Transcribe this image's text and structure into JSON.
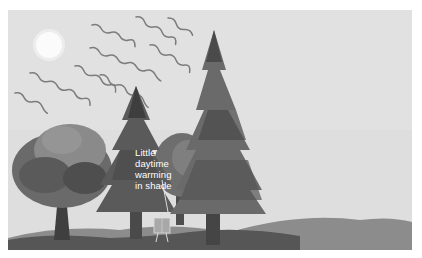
{
  "diagram": {
    "type": "illustration",
    "callout": {
      "lines": [
        "Little",
        "daytime",
        "warming",
        "in shade"
      ]
    },
    "elements": [
      "sun",
      "wavy-sun-rays",
      "deciduous-tree-left",
      "conifer-tree-middle",
      "conifer-tree-tall",
      "deciduous-tree-back",
      "instrument-shelter",
      "ground-hills"
    ],
    "colors": {
      "sky": "#dcdcdc",
      "sun": "#f4f4f4",
      "ray": "#7a7a7a",
      "tree_dark": "#3c3c3c",
      "tree_mid": "#6a6a6a",
      "tree_light": "#8e8e8e",
      "trunk": "#4a4a4a",
      "ground_dark": "#555555",
      "ground_mid": "#8a8a8a",
      "shelter": "#a8a8a8"
    }
  }
}
